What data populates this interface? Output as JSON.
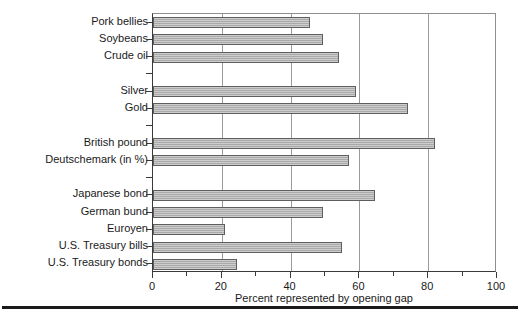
{
  "chart_data": {
    "type": "bar",
    "orientation": "horizontal",
    "title": "",
    "xlabel": "Percent represented by opening gap",
    "ylabel": "",
    "xlim": [
      0,
      100
    ],
    "xticks": [
      0,
      20,
      40,
      60,
      80,
      100
    ],
    "xtick_labels": [
      "0",
      "20",
      "40",
      "60",
      "80",
      "100"
    ],
    "minor_xticks": [
      10,
      30,
      50,
      70,
      90
    ],
    "grid": "vertical",
    "legend": "none",
    "bar_color": "#a9a9a9",
    "bar_edge_color": "#5e5e5e",
    "categories": [
      "Pork bellies",
      "Soybeans",
      "Crude oil",
      "Silver",
      "Gold",
      "British pound",
      "Deutschemark (in %)",
      "Japanese bond",
      "German bund",
      "Euroyen",
      "U.S. Treasury bills",
      "U.S. Treasury bonds"
    ],
    "values": [
      45.7,
      49.4,
      54.0,
      59.0,
      74.0,
      82.0,
      57.0,
      64.5,
      49.5,
      21.0,
      55.0,
      24.5
    ],
    "groups": [
      {
        "name": "commodities",
        "categories": [
          "Pork bellies",
          "Soybeans",
          "Crude oil"
        ]
      },
      {
        "name": "metals",
        "categories": [
          "Silver",
          "Gold"
        ]
      },
      {
        "name": "currencies",
        "categories": [
          "British pound",
          "Deutschemark (in %)"
        ]
      },
      {
        "name": "interest-rate",
        "categories": [
          "Japanese bond",
          "German bund",
          "Euroyen",
          "U.S. Treasury bills",
          "U.S. Treasury bonds"
        ]
      }
    ],
    "slots": [
      {
        "label": "Pork bellies",
        "value": 45.7
      },
      {
        "label": "Soybeans",
        "value": 49.4
      },
      {
        "label": "Crude oil",
        "value": 54.0
      },
      {
        "label": "",
        "value": null
      },
      {
        "label": "Silver",
        "value": 59.0
      },
      {
        "label": "Gold",
        "value": 74.0
      },
      {
        "label": "",
        "value": null
      },
      {
        "label": "British pound",
        "value": 82.0
      },
      {
        "label": "Deutschemark (in %)",
        "value": 57.0
      },
      {
        "label": "",
        "value": null
      },
      {
        "label": "Japanese bond",
        "value": 64.5
      },
      {
        "label": "German bund",
        "value": 49.5
      },
      {
        "label": "Euroyen",
        "value": 21.0
      },
      {
        "label": "U.S. Treasury bills",
        "value": 55.0
      },
      {
        "label": "U.S. Treasury bonds",
        "value": 24.5
      }
    ]
  }
}
